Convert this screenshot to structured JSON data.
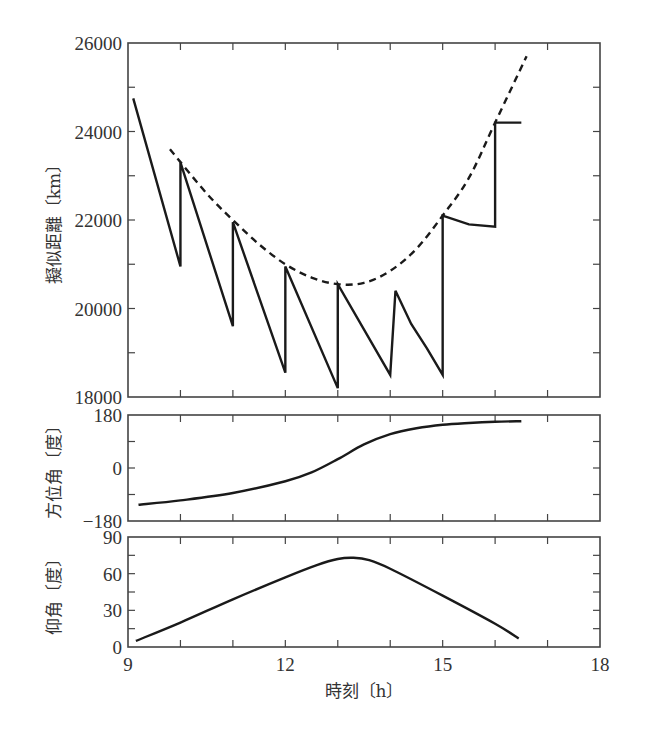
{
  "chart_data": [
    {
      "type": "line",
      "panel": "pseudorange",
      "ylabel": "擬似距離〔km〕",
      "xlim": [
        9,
        18
      ],
      "ylim": [
        18000,
        26000
      ],
      "yticks": [
        18000,
        20000,
        22000,
        24000,
        26000
      ],
      "yminor_step": 1000,
      "xticks_minor_step": 1,
      "series": [
        {
          "name": "measured-pseudorange",
          "style": "solid",
          "points": [
            [
              9.1,
              24750
            ],
            [
              10.0,
              20950
            ],
            [
              10.0,
              23300
            ],
            [
              11.0,
              19600
            ],
            [
              11.0,
              21950
            ],
            [
              12.0,
              18550
            ],
            [
              12.0,
              20950
            ],
            [
              13.0,
              18200
            ],
            [
              13.0,
              20550
            ],
            [
              14.0,
              18500
            ],
            [
              14.1,
              20400
            ],
            [
              14.4,
              19650
            ],
            [
              14.7,
              19100
            ],
            [
              15.0,
              18500
            ],
            [
              15.0,
              22100
            ],
            [
              15.5,
              21900
            ],
            [
              16.0,
              21850
            ],
            [
              16.0,
              24200
            ],
            [
              16.5,
              24200
            ]
          ]
        },
        {
          "name": "true-range",
          "style": "dashed",
          "points": [
            [
              9.8,
              23600
            ],
            [
              10.5,
              22600
            ],
            [
              11.0,
              22000
            ],
            [
              11.5,
              21450
            ],
            [
              12.0,
              21000
            ],
            [
              12.5,
              20700
            ],
            [
              13.0,
              20550
            ],
            [
              13.5,
              20580
            ],
            [
              14.0,
              20850
            ],
            [
              14.5,
              21350
            ],
            [
              15.0,
              22100
            ],
            [
              15.5,
              22950
            ],
            [
              16.0,
              24200
            ],
            [
              16.6,
              25700
            ]
          ]
        }
      ]
    },
    {
      "type": "line",
      "panel": "azimuth",
      "ylabel": "方位角〔度〕",
      "xlim": [
        9,
        18
      ],
      "ylim": [
        -180,
        180
      ],
      "yticks": [
        -180,
        0,
        180
      ],
      "ytick_labels": [
        "−180",
        "0",
        "180"
      ],
      "yminor": [
        -90,
        90
      ],
      "series": [
        {
          "name": "azimuth",
          "style": "solid",
          "points": [
            [
              9.2,
              -125
            ],
            [
              10.0,
              -110
            ],
            [
              11.0,
              -85
            ],
            [
              12.0,
              -45
            ],
            [
              12.5,
              -15
            ],
            [
              13.0,
              30
            ],
            [
              13.5,
              80
            ],
            [
              14.0,
              115
            ],
            [
              14.5,
              135
            ],
            [
              15.0,
              147
            ],
            [
              15.5,
              153
            ],
            [
              16.0,
              157
            ],
            [
              16.5,
              159
            ]
          ]
        }
      ]
    },
    {
      "type": "line",
      "panel": "elevation",
      "ylabel": "仰角〔度〕",
      "xlabel": "時刻〔h〕",
      "xlim": [
        9,
        18
      ],
      "ylim": [
        0,
        90
      ],
      "yticks": [
        0,
        30,
        60,
        90
      ],
      "yminor": [
        15,
        45,
        75
      ],
      "xticks": [
        9,
        12,
        15,
        18
      ],
      "series": [
        {
          "name": "elevation",
          "style": "solid",
          "points": [
            [
              9.15,
              5
            ],
            [
              10.0,
              20
            ],
            [
              11.0,
              39
            ],
            [
              12.0,
              57
            ],
            [
              12.6,
              67
            ],
            [
              13.0,
              72
            ],
            [
              13.3,
              73
            ],
            [
              13.6,
              71
            ],
            [
              14.0,
              64
            ],
            [
              15.0,
              42
            ],
            [
              16.0,
              19
            ],
            [
              16.45,
              7
            ]
          ]
        }
      ]
    }
  ]
}
